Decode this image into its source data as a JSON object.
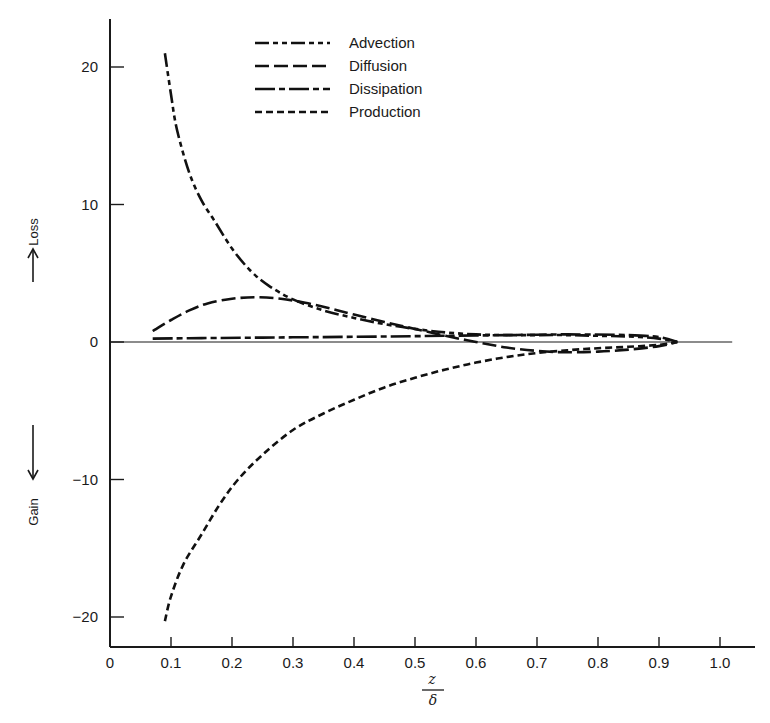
{
  "chart_data": {
    "type": "line",
    "title": "",
    "xlabel": "z/δ",
    "xlabel_num": "z",
    "xlabel_den": "δ",
    "ylabel_top": "Loss",
    "ylabel_bottom": "Gain",
    "xlim": [
      0,
      1.05
    ],
    "ylim": [
      -22,
      23
    ],
    "grid": false,
    "legend_position": "top-center",
    "x_ticks": [
      0,
      0.1,
      0.2,
      0.3,
      0.4,
      0.5,
      0.6,
      0.7,
      0.8,
      0.9,
      1.0
    ],
    "x_tick_labels": [
      "0",
      "0.1",
      "0.2",
      "0.3",
      "0.4",
      "0.5",
      "0.6",
      "0.7",
      "0.8",
      "0.9",
      "1.0"
    ],
    "y_ticks": [
      20,
      10,
      0,
      -10,
      -20
    ],
    "y_tick_labels": [
      "20",
      "10",
      "0",
      "−10",
      "−20"
    ],
    "zero_line_xmax": 1.02,
    "series": [
      {
        "name": "Advection",
        "dash": "14 4 5 4 5 4",
        "x": [
          0.09,
          0.1,
          0.11,
          0.13,
          0.15,
          0.17,
          0.2,
          0.23,
          0.26,
          0.3,
          0.35,
          0.4,
          0.45,
          0.5,
          0.55,
          0.6,
          0.65,
          0.7,
          0.75,
          0.8,
          0.85,
          0.9,
          0.93
        ],
        "values": [
          21.0,
          18.0,
          15.4,
          12.3,
          10.3,
          8.9,
          6.8,
          5.2,
          4.1,
          3.1,
          2.3,
          1.75,
          1.3,
          0.95,
          0.7,
          0.55,
          0.5,
          0.5,
          0.5,
          0.45,
          0.4,
          0.25,
          0.0
        ]
      },
      {
        "name": "Diffusion",
        "dash": "14 5",
        "x": [
          0.07,
          0.1,
          0.13,
          0.16,
          0.2,
          0.24,
          0.28,
          0.32,
          0.36,
          0.4,
          0.45,
          0.5,
          0.55,
          0.6,
          0.65,
          0.7,
          0.75,
          0.8,
          0.85,
          0.9,
          0.93
        ],
        "values": [
          0.8,
          1.6,
          2.3,
          2.8,
          3.15,
          3.25,
          3.15,
          2.85,
          2.45,
          2.0,
          1.45,
          0.95,
          0.45,
          0.0,
          -0.4,
          -0.65,
          -0.75,
          -0.7,
          -0.55,
          -0.3,
          0.0
        ]
      },
      {
        "name": "Dissipation",
        "dash": "20 4 6 4",
        "x": [
          0.07,
          0.15,
          0.25,
          0.35,
          0.45,
          0.55,
          0.65,
          0.75,
          0.85,
          0.9,
          0.93
        ],
        "values": [
          0.25,
          0.28,
          0.32,
          0.36,
          0.4,
          0.45,
          0.5,
          0.55,
          0.5,
          0.35,
          0.0
        ]
      },
      {
        "name": "Production",
        "dash": "7 4",
        "x": [
          0.09,
          0.1,
          0.12,
          0.15,
          0.18,
          0.21,
          0.25,
          0.3,
          0.35,
          0.4,
          0.45,
          0.5,
          0.55,
          0.6,
          0.65,
          0.7,
          0.75,
          0.8,
          0.85,
          0.9,
          0.93
        ],
        "values": [
          -20.3,
          -18.5,
          -16.2,
          -14.0,
          -11.8,
          -10.0,
          -8.2,
          -6.4,
          -5.2,
          -4.2,
          -3.3,
          -2.6,
          -2.0,
          -1.5,
          -1.1,
          -0.8,
          -0.6,
          -0.45,
          -0.35,
          -0.2,
          0.0
        ]
      }
    ]
  },
  "legend": {
    "items": [
      {
        "label": "Advection"
      },
      {
        "label": "Diffusion"
      },
      {
        "label": "Dissipation"
      },
      {
        "label": "Production"
      }
    ]
  },
  "axis": {
    "loss_label": "Loss",
    "gain_label": "Gain",
    "x_num": "z",
    "x_den": "δ"
  }
}
